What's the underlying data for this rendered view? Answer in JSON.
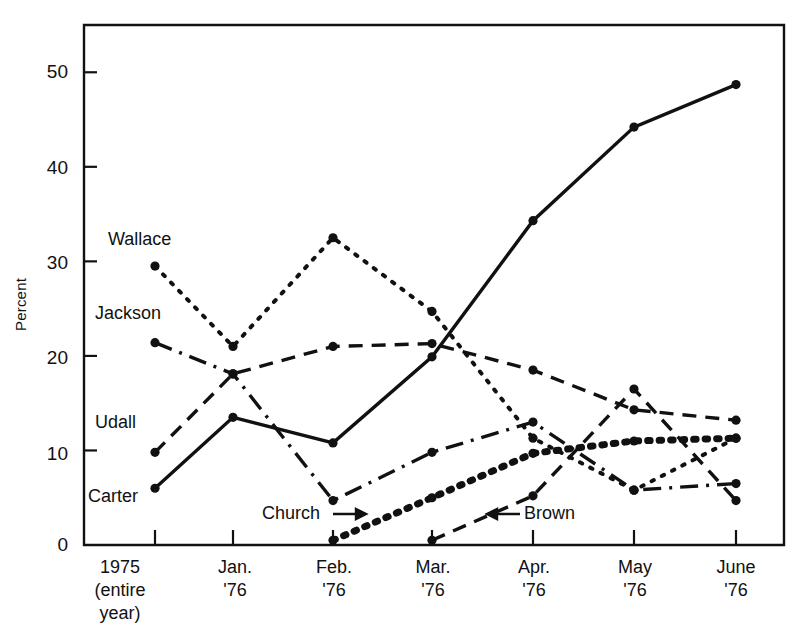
{
  "chart_data": {
    "type": "line",
    "title": "",
    "xlabel": "",
    "ylabel": "Percent",
    "ylim": [
      0,
      55
    ],
    "yticks": [
      0,
      10,
      20,
      30,
      40,
      50
    ],
    "grid": false,
    "legend_position": "inline-annotations",
    "categories": [
      "1975 (entire year)",
      "Jan. '76",
      "Feb. '76",
      "Mar. '76",
      "Apr. '76",
      "May '76",
      "June '76"
    ],
    "category_lines": [
      [
        "1975",
        "(entire",
        "year)"
      ],
      [
        "Jan.",
        "'76"
      ],
      [
        "Feb.",
        "'76"
      ],
      [
        "Mar.",
        "'76"
      ],
      [
        "Apr.",
        "'76"
      ],
      [
        "May",
        "'76"
      ],
      [
        "June",
        "'76"
      ]
    ],
    "series": [
      {
        "name": "Carter",
        "style": "solid",
        "values": [
          6.0,
          13.5,
          10.8,
          19.9,
          34.3,
          44.2,
          48.7
        ],
        "label": "Carter",
        "label_x": 88,
        "label_y": 494
      },
      {
        "name": "Jackson",
        "style": "dashdot",
        "values": [
          21.4,
          18.1,
          4.7,
          9.8,
          13.0,
          5.8,
          6.5
        ],
        "label": "Jackson",
        "label_x": 95,
        "label_y": 313
      },
      {
        "name": "Udall",
        "style": "dashed",
        "values": [
          9.8,
          18.1,
          21.0,
          21.3,
          18.5,
          14.3,
          13.2
        ],
        "label": "Udall",
        "label_x": 95,
        "label_y": 422
      },
      {
        "name": "Wallace",
        "style": "dotted",
        "values": [
          29.5,
          21.0,
          32.5,
          24.7,
          11.3,
          5.8,
          11.3
        ],
        "label": "Wallace",
        "label_x": 108,
        "label_y": 240
      },
      {
        "name": "Church",
        "style": "thickdotted",
        "values": [
          null,
          null,
          0.5,
          5.0,
          9.7,
          11.0,
          11.3
        ],
        "label": "Church",
        "label_x": 262,
        "label_y": 511
      },
      {
        "name": "Brown",
        "style": "dashed",
        "values": [
          null,
          null,
          null,
          0.5,
          5.2,
          16.5,
          4.7
        ],
        "label": "Brown",
        "label_x": 524,
        "label_y": 511
      }
    ],
    "annotations": [
      {
        "name": "church-arrow",
        "text": "→",
        "from": "Church",
        "direction": "right"
      },
      {
        "name": "brown-arrow",
        "text": "←",
        "from": "Brown",
        "direction": "left"
      }
    ]
  },
  "axis": {
    "y_title": "Percent",
    "y_tick_labels": [
      "50",
      "40",
      "30",
      "20",
      "10",
      "0"
    ],
    "x_tick_labels": [
      "1975",
      "(entire",
      "year)",
      "Jan.",
      "'76",
      "Feb.",
      "'76",
      "Mar.",
      "'76",
      "Apr.",
      "'76",
      "May",
      "'76",
      "June",
      "'76"
    ]
  },
  "colors": {
    "ink": "#111111",
    "background": "#ffffff",
    "axis": "#111111"
  }
}
